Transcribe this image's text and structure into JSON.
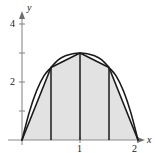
{
  "figure": {
    "name": "trapezoidal-rule-approximation",
    "background_color": "#ffffff",
    "region_fill_color": "#e2e2e2",
    "curve_color": "#1a1a1a",
    "axis_color": "#8a8a8a"
  },
  "axes": {
    "x_axis_label": "x",
    "y_axis_label": "y",
    "x_tick_labels": [
      "1",
      "2"
    ],
    "y_tick_labels": [
      "2",
      "4"
    ]
  },
  "chart_data": {
    "type": "area",
    "title": "",
    "subtitle": "",
    "xlabel": "x",
    "ylabel": "y",
    "xlim": [
      0,
      2.25
    ],
    "ylim": [
      0,
      4.4
    ],
    "grid": false,
    "legend": "none",
    "x_ticks": [
      1,
      2
    ],
    "x_tick_labels": [
      "1",
      "2"
    ],
    "y_ticks": [
      1,
      2,
      3,
      4
    ],
    "y_tick_labels": [
      "",
      "2",
      "",
      "4"
    ],
    "y_labeled_ticks": [
      2,
      4
    ],
    "annotations": [],
    "series": [
      {
        "name": "curve",
        "kind": "line",
        "description": "smooth concave-down curve through (0,0) and (2,0) peaking near (1,3)",
        "x": [
          0,
          0.125,
          0.25,
          0.375,
          0.5,
          0.625,
          0.75,
          0.875,
          1,
          1.125,
          1.25,
          1.375,
          1.5,
          1.625,
          1.75,
          1.875,
          2
        ],
        "values": [
          0,
          0.953,
          1.688,
          2.203,
          2.5,
          2.766,
          2.906,
          2.977,
          3,
          2.977,
          2.906,
          2.766,
          2.5,
          2.203,
          1.688,
          0.953,
          0
        ]
      },
      {
        "name": "trapezoid-chords",
        "kind": "line",
        "description": "straight chord tops of the four trapezoids",
        "x": [
          0,
          0.5,
          1,
          1.5,
          2
        ],
        "values": [
          0,
          2.5,
          3,
          2.5,
          0
        ]
      },
      {
        "name": "trapezoid-dividers",
        "kind": "vertical-lines",
        "description": "interior vertical segments at the subinterval boundaries",
        "x": [
          0.5,
          1,
          1.5
        ],
        "values": [
          2.5,
          3,
          2.5
        ]
      }
    ],
    "subintervals": 4,
    "delta_x": 0.5,
    "interval": [
      0,
      2
    ]
  }
}
